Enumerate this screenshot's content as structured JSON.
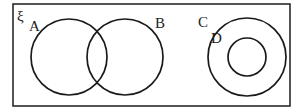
{
  "diagram": {
    "type": "venn",
    "universal_set": {
      "label": "ξ"
    },
    "sets": [
      {
        "id": "A",
        "label": "A"
      },
      {
        "id": "B",
        "label": "B"
      },
      {
        "id": "C",
        "label": "C"
      },
      {
        "id": "D",
        "label": "D"
      }
    ],
    "relationships": [
      "A and B overlap",
      "D is a subset of C",
      "C is disjoint from A and B"
    ],
    "colors": {
      "stroke": "#1a1a1a",
      "background": "#ffffff"
    }
  }
}
